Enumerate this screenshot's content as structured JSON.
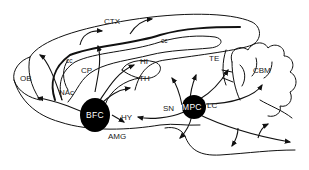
{
  "diagram": {
    "type": "sagittal brain section with cholinergic projections",
    "nuclei": [
      {
        "id": "bfc",
        "label": "BFC"
      },
      {
        "id": "mpc",
        "label": "MPC"
      }
    ],
    "regions": [
      {
        "id": "ctx",
        "label": "CTX"
      },
      {
        "id": "cc_left",
        "label": "cc"
      },
      {
        "id": "cc_top",
        "label": "cc"
      },
      {
        "id": "cp",
        "label": "CP"
      },
      {
        "id": "hi",
        "label": "HI"
      },
      {
        "id": "th",
        "label": "TH"
      },
      {
        "id": "te",
        "label": "TE"
      },
      {
        "id": "cbm",
        "label": "CBM"
      },
      {
        "id": "ob",
        "label": "OB"
      },
      {
        "id": "nac",
        "label": "NAc"
      },
      {
        "id": "hy",
        "label": "HY"
      },
      {
        "id": "amg",
        "label": "AMG"
      },
      {
        "id": "sn",
        "label": "SN"
      },
      {
        "id": "lc",
        "label": "LC"
      }
    ],
    "colors": {
      "line": "#111111",
      "nucleus_fill": "#000000",
      "nucleus_text": "#ffffff",
      "background": "#ffffff"
    }
  }
}
